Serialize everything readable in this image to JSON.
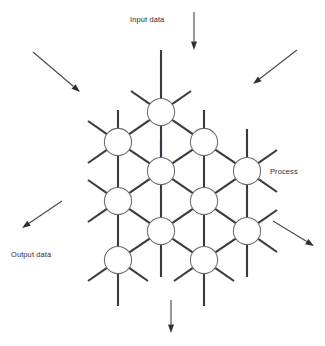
{
  "diagram": {
    "colors": {
      "background": "#ffffff",
      "link": "#3a3a42",
      "node_stroke": "#6b6b72",
      "node_fill": "#ffffff",
      "arrow": "#4a4a52",
      "arrow_head": "#2e2e34",
      "text": "#2b2b30"
    },
    "labels": {
      "input": "Input data",
      "output": "Output data",
      "process": "Process"
    },
    "label_positions": {
      "input": {
        "x": 130,
        "y": 22,
        "anchor": "start"
      },
      "output": {
        "x": 11,
        "y": 257,
        "anchor": "start"
      },
      "process": {
        "x": 270,
        "y": 174,
        "anchor": "start"
      }
    },
    "node_radius": 13.6,
    "nodes": [
      {
        "id": "n1",
        "x": 161,
        "y": 112,
        "row": 1,
        "col": 1
      },
      {
        "id": "n2",
        "x": 118,
        "y": 142,
        "row": 2,
        "col": 1
      },
      {
        "id": "n3",
        "x": 204,
        "y": 142,
        "row": 2,
        "col": 2
      },
      {
        "id": "n4",
        "x": 161,
        "y": 171,
        "row": 3,
        "col": 1
      },
      {
        "id": "n5",
        "x": 247,
        "y": 171,
        "row": 3,
        "col": 2
      },
      {
        "id": "n6",
        "x": 118,
        "y": 201,
        "row": 4,
        "col": 1
      },
      {
        "id": "n7",
        "x": 204,
        "y": 201,
        "row": 4,
        "col": 2
      },
      {
        "id": "n8",
        "x": 161,
        "y": 231,
        "row": 5,
        "col": 1
      },
      {
        "id": "n9",
        "x": 247,
        "y": 231,
        "row": 5,
        "col": 2
      },
      {
        "id": "n10",
        "x": 118,
        "y": 260,
        "row": 6,
        "col": 1
      },
      {
        "id": "n11",
        "x": 204,
        "y": 260,
        "row": 6,
        "col": 2
      }
    ],
    "links": [
      {
        "from": "n1",
        "to": "n2"
      },
      {
        "from": "n1",
        "to": "n3"
      },
      {
        "from": "n1",
        "to": "n4"
      },
      {
        "from": "n2",
        "to": "n4"
      },
      {
        "from": "n2",
        "to": "n6"
      },
      {
        "from": "n3",
        "to": "n4"
      },
      {
        "from": "n3",
        "to": "n5"
      },
      {
        "from": "n3",
        "to": "n7"
      },
      {
        "from": "n4",
        "to": "n6"
      },
      {
        "from": "n4",
        "to": "n7"
      },
      {
        "from": "n4",
        "to": "n8"
      },
      {
        "from": "n5",
        "to": "n7"
      },
      {
        "from": "n5",
        "to": "n9"
      },
      {
        "from": "n6",
        "to": "n8"
      },
      {
        "from": "n6",
        "to": "n10"
      },
      {
        "from": "n7",
        "to": "n8"
      },
      {
        "from": "n7",
        "to": "n9"
      },
      {
        "from": "n7",
        "to": "n11"
      },
      {
        "from": "n8",
        "to": "n10"
      },
      {
        "from": "n8",
        "to": "n11"
      },
      {
        "from": "n9",
        "to": "n11"
      }
    ],
    "stubs": [
      {
        "node": "n1",
        "dx": 0,
        "dy": -62
      },
      {
        "node": "n1",
        "dx": -30,
        "dy": -21
      },
      {
        "node": "n1",
        "dx": 30,
        "dy": -21
      },
      {
        "node": "n2",
        "dx": 0,
        "dy": -32
      },
      {
        "node": "n2",
        "dx": -30,
        "dy": -21
      },
      {
        "node": "n2",
        "dx": -30,
        "dy": 21
      },
      {
        "node": "n3",
        "dx": 0,
        "dy": -32
      },
      {
        "node": "n4",
        "dx": 0,
        "dy": -30
      },
      {
        "node": "n5",
        "dx": 0,
        "dy": -42
      },
      {
        "node": "n5",
        "dx": 30,
        "dy": -21
      },
      {
        "node": "n5",
        "dx": 30,
        "dy": 21
      },
      {
        "node": "n6",
        "dx": -30,
        "dy": -21
      },
      {
        "node": "n6",
        "dx": -30,
        "dy": 21
      },
      {
        "node": "n8",
        "dx": 0,
        "dy": 46
      },
      {
        "node": "n9",
        "dx": 30,
        "dy": -21
      },
      {
        "node": "n9",
        "dx": 30,
        "dy": 21
      },
      {
        "node": "n9",
        "dx": 0,
        "dy": 46
      },
      {
        "node": "n10",
        "dx": -30,
        "dy": 21
      },
      {
        "node": "n10",
        "dx": 30,
        "dy": 21
      },
      {
        "node": "n10",
        "dx": 0,
        "dy": 46
      },
      {
        "node": "n11",
        "dx": -30,
        "dy": 21
      },
      {
        "node": "n11",
        "dx": 30,
        "dy": 21
      },
      {
        "node": "n11",
        "dx": 0,
        "dy": 46
      }
    ],
    "arrows": [
      {
        "id": "arrow-input-top",
        "x1": 194,
        "y1": 12,
        "x2": 194,
        "y2": 50
      },
      {
        "id": "arrow-input-left",
        "x1": 33,
        "y1": 52,
        "x2": 80,
        "y2": 92
      },
      {
        "id": "arrow-input-right",
        "x1": 297,
        "y1": 50,
        "x2": 253,
        "y2": 84
      },
      {
        "id": "arrow-output-left",
        "x1": 62,
        "y1": 201,
        "x2": 22,
        "y2": 228
      },
      {
        "id": "arrow-output-right",
        "x1": 273,
        "y1": 221,
        "x2": 314,
        "y2": 246
      },
      {
        "id": "arrow-output-bottom",
        "x1": 171,
        "y1": 300,
        "x2": 171,
        "y2": 333
      }
    ]
  }
}
